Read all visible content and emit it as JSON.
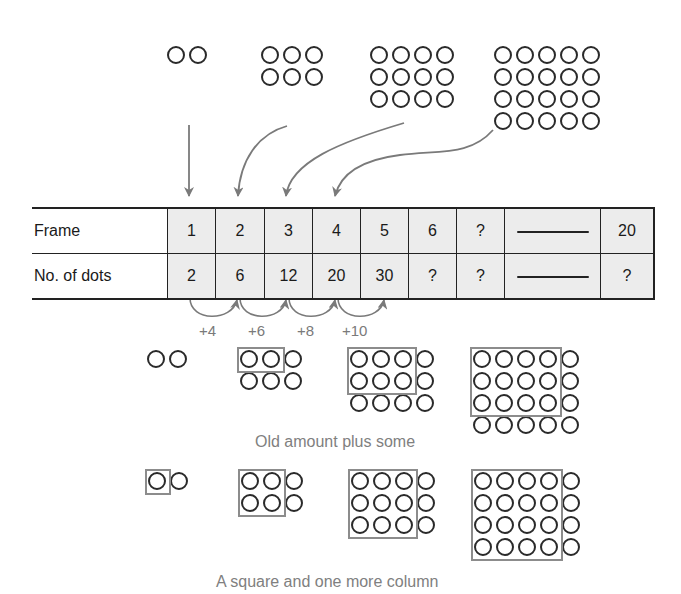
{
  "top_frames": [
    {
      "frame": 1,
      "cols": 2,
      "rows": 1,
      "x": 167,
      "y": 46
    },
    {
      "frame": 2,
      "cols": 3,
      "rows": 2,
      "x": 261,
      "y": 46
    },
    {
      "frame": 3,
      "cols": 4,
      "rows": 3,
      "x": 370,
      "y": 46
    },
    {
      "frame": 4,
      "cols": 5,
      "rows": 4,
      "x": 494,
      "y": 46
    }
  ],
  "table": {
    "row_labels": [
      "Frame",
      "No. of dots"
    ],
    "frame_row": [
      "1",
      "2",
      "3",
      "4",
      "5",
      "6",
      "?",
      "—",
      "20"
    ],
    "dots_row": [
      "2",
      "6",
      "12",
      "20",
      "30",
      "?",
      "?",
      "—",
      "?"
    ]
  },
  "increments": [
    "+4",
    "+6",
    "+8",
    "+10"
  ],
  "middle_section": {
    "caption": "Old amount plus some",
    "frames": [
      {
        "frame": 1,
        "cols": 2,
        "rows": 1,
        "x": 147,
        "y": 350,
        "box": null
      },
      {
        "frame": 2,
        "cols": 3,
        "rows": 2,
        "x": 240,
        "y": 350,
        "box": {
          "cols": 2,
          "rows": 1
        }
      },
      {
        "frame": 3,
        "cols": 4,
        "rows": 3,
        "x": 350,
        "y": 350,
        "box": {
          "cols": 3,
          "rows": 2
        }
      },
      {
        "frame": 4,
        "cols": 5,
        "rows": 4,
        "x": 473,
        "y": 350,
        "box": {
          "cols": 4,
          "rows": 3
        }
      }
    ]
  },
  "bottom_section": {
    "caption": "A square and one more column",
    "frames": [
      {
        "frame": 1,
        "cols": 2,
        "rows": 1,
        "x": 148,
        "y": 472,
        "box": {
          "cols": 1,
          "rows": 1
        }
      },
      {
        "frame": 2,
        "cols": 3,
        "rows": 2,
        "x": 241,
        "y": 472,
        "box": {
          "cols": 2,
          "rows": 2
        }
      },
      {
        "frame": 3,
        "cols": 4,
        "rows": 3,
        "x": 351,
        "y": 472,
        "box": {
          "cols": 3,
          "rows": 3
        }
      },
      {
        "frame": 4,
        "cols": 5,
        "rows": 4,
        "x": 474,
        "y": 472,
        "box": {
          "cols": 4,
          "rows": 4
        }
      }
    ]
  },
  "colors": {
    "dot_stroke": "#2a2a2a",
    "box_stroke": "#8c8c8c",
    "arrow": "#7a7a7a",
    "cell_fill": "#ececec",
    "caption": "#808080"
  }
}
